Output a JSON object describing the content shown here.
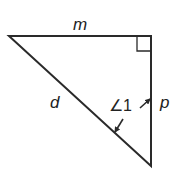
{
  "diagram": {
    "type": "right-triangle",
    "vertices": {
      "top_left": [
        9,
        36
      ],
      "top_right_right_angle": [
        151,
        36
      ],
      "bottom": [
        151,
        166
      ]
    },
    "labels": {
      "top_side": "m",
      "hypotenuse": "d",
      "right_side": "p",
      "angle": "∠1"
    },
    "colors": {
      "stroke": "#2a2a2a",
      "background": "#ffffff"
    }
  }
}
